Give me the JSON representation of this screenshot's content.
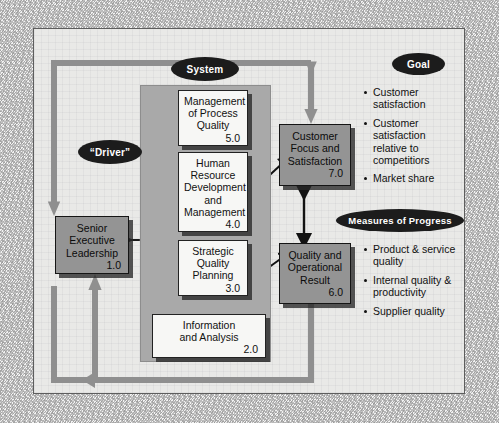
{
  "diagram": {
    "labels": {
      "system": "System",
      "driver": "“Driver”",
      "goal": "Goal",
      "measures": "Measures of Progress"
    },
    "driver_box": {
      "line1": "Senior",
      "line2": "Executive",
      "line3": "Leadership",
      "number": "1.0"
    },
    "system_boxes": [
      {
        "lines": [
          "Management",
          "of Process",
          "Quality"
        ],
        "number": "5.0"
      },
      {
        "lines": [
          "Human",
          "Resource",
          "Development",
          "and",
          "Management"
        ],
        "number": "4.0"
      },
      {
        "lines": [
          "Strategic",
          "Quality",
          "Planning"
        ],
        "number": "3.0"
      },
      {
        "lines": [
          "Information",
          "and Analysis"
        ],
        "number": "2.0"
      }
    ],
    "result_boxes": [
      {
        "lines": [
          "Customer",
          "Focus and",
          "Satisfaction"
        ],
        "number": "7.0"
      },
      {
        "lines": [
          "Quality and",
          "Operational",
          "Result"
        ],
        "number": "6.0"
      }
    ],
    "goal_bullets": [
      "Customer satisfaction",
      "Customer satisfaction relative to competitiors",
      "Market share"
    ],
    "measures_bullets": [
      "Product & service quality",
      "Internal quality & productivity",
      "Supplier quality"
    ],
    "colors": {
      "grey_box": "#949494",
      "white_box": "#f7f7f5",
      "system_fill": "#a9a9a9",
      "panel": "#e9e9e7",
      "ellipse": "#1c1c1c",
      "loop": "#8f8f8f"
    }
  }
}
